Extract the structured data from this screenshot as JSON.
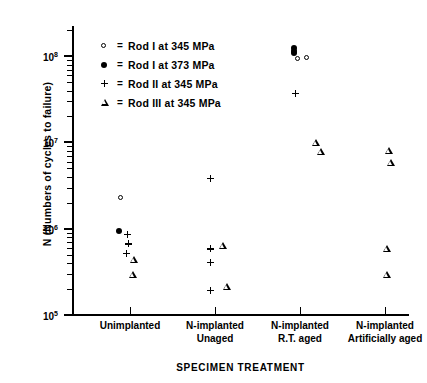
{
  "chart_data": {
    "type": "scatter",
    "title": "",
    "xlabel": "SPECIMEN TREATMENT",
    "ylabel": "N  (Numbers of cycles to failure)",
    "yscale": "log",
    "ylim": [
      100000,
      300000000
    ],
    "ytick_labels": [
      "10",
      "10",
      "10",
      "10"
    ],
    "ytick_exponents": [
      "8",
      "7",
      "6",
      "5"
    ],
    "ytick_values": [
      100000000,
      10000000,
      1000000,
      100000
    ],
    "grid": false,
    "legend_position": "upper-left",
    "categories": [
      "Unimplanted",
      "N-implanted\nUnaged",
      "N-implanted\nR.T. aged",
      "N-implanted\nArtificially aged"
    ],
    "category_labels": [
      {
        "line1": "Unimplanted",
        "line2": ""
      },
      {
        "line1": "N-implanted",
        "line2": "Unaged"
      },
      {
        "line1": "N-implanted",
        "line2": "R.T. aged"
      },
      {
        "line1": "N-implanted",
        "line2": "Artificially aged"
      }
    ],
    "series": [
      {
        "name": "Rod I at 345 MPa",
        "marker": "open-circle",
        "points": [
          {
            "category": 0,
            "value": 2300000
          },
          {
            "category": 2,
            "value": 92000000
          },
          {
            "category": 2,
            "value": 95000000
          }
        ]
      },
      {
        "name": "Rod I at 373 MPa",
        "marker": "filled-circle",
        "points": [
          {
            "category": 0,
            "value": 950000
          },
          {
            "category": 2,
            "value": 125000000
          },
          {
            "category": 2,
            "value": 115000000
          },
          {
            "category": 2,
            "value": 108000000
          }
        ]
      },
      {
        "name": "Rod II at 345 MPa",
        "marker": "plus",
        "points": [
          {
            "category": 0,
            "value": 880000
          },
          {
            "category": 0,
            "value": 820000
          },
          {
            "category": 0,
            "value": 760000
          },
          {
            "category": 1,
            "value": 6800000
          },
          {
            "category": 1,
            "value": 1250000
          },
          {
            "category": 1,
            "value": 1050000
          },
          {
            "category": 1,
            "value": 600000
          },
          {
            "category": 2,
            "value": 140000000
          }
        ]
      },
      {
        "name": "Rod III at 345 MPa",
        "marker": "triangle",
        "points": [
          {
            "category": 0,
            "value": 2000000
          },
          {
            "category": 0,
            "value": 1600000
          },
          {
            "category": 1,
            "value": 4200000
          },
          {
            "category": 1,
            "value": 1700000
          },
          {
            "category": 2,
            "value": 96000000
          },
          {
            "category": 2,
            "value": 90000000
          },
          {
            "category": 3,
            "value": 112000000
          },
          {
            "category": 3,
            "value": 98000000
          },
          {
            "category": 3,
            "value": 12000000
          },
          {
            "category": 3,
            "value": 7200000
          }
        ]
      }
    ]
  },
  "legend": {
    "items": [
      {
        "symbol": "open-circle",
        "eq": "=",
        "label": "Rod I at  345 MPa"
      },
      {
        "symbol": "filled-circle",
        "eq": "=",
        "label": "Rod I at 373 MPa"
      },
      {
        "symbol": "plus",
        "eq": "=",
        "label": "Rod II at  345 MPa"
      },
      {
        "symbol": "triangle",
        "eq": "=",
        "label": "Rod III at  345 MPa"
      }
    ]
  },
  "colors": {
    "axis": "#000000",
    "marker": "#000000",
    "background": "#ffffff"
  }
}
